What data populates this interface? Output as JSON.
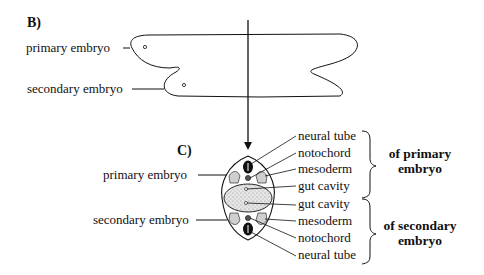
{
  "figure": {
    "panel_b": {
      "label": "B)",
      "labels": {
        "primary": "primary embryo",
        "secondary": "secondary embryo"
      }
    },
    "panel_c": {
      "label": "C)",
      "left_labels": {
        "primary": "primary embryo",
        "secondary": "secondary embryo"
      },
      "right_labels": [
        "neural tube",
        "notochord",
        "mesoderm",
        "gut cavity",
        "gut cavity",
        "mesoderm",
        "notochord",
        "neural tube"
      ],
      "groups": [
        {
          "line1": "of primary",
          "line2": "embryo"
        },
        {
          "line1": "of secondary",
          "line2": "embryo"
        }
      ]
    }
  }
}
